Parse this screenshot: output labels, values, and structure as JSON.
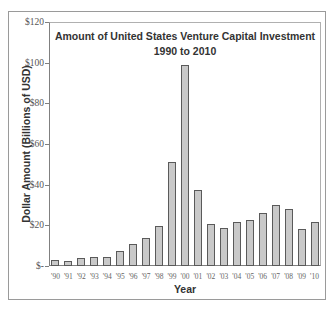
{
  "chart_data": {
    "type": "bar",
    "title": "Amount of United States Venture Capital Investment",
    "subtitle": "1990 to 2010",
    "xlabel": "Year",
    "ylabel": "Dollar Amount (Billions of USD)",
    "ylim": [
      0,
      120
    ],
    "yticks": [
      "$-",
      "$20",
      "$40",
      "$60",
      "$80",
      "$100",
      "$120"
    ],
    "grid": false,
    "legend": null,
    "categories": [
      "'90",
      "'91",
      "'92",
      "'93",
      "'94",
      "'95",
      "'96",
      "'97",
      "'98",
      "'99",
      "'00",
      "'01",
      "'02",
      "'03",
      "'04",
      "'05",
      "'06",
      "'07",
      "'08",
      "'09",
      "'10"
    ],
    "values": [
      3,
      2.5,
      4,
      4.5,
      4.5,
      7.5,
      11,
      14,
      19.5,
      51,
      99,
      37.5,
      20.5,
      18.5,
      21.5,
      22.5,
      26,
      30,
      28,
      18,
      21.5
    ]
  },
  "colors": {
    "bar_fill": "#c9c9c9",
    "bar_stroke": "#5a5a5a"
  }
}
